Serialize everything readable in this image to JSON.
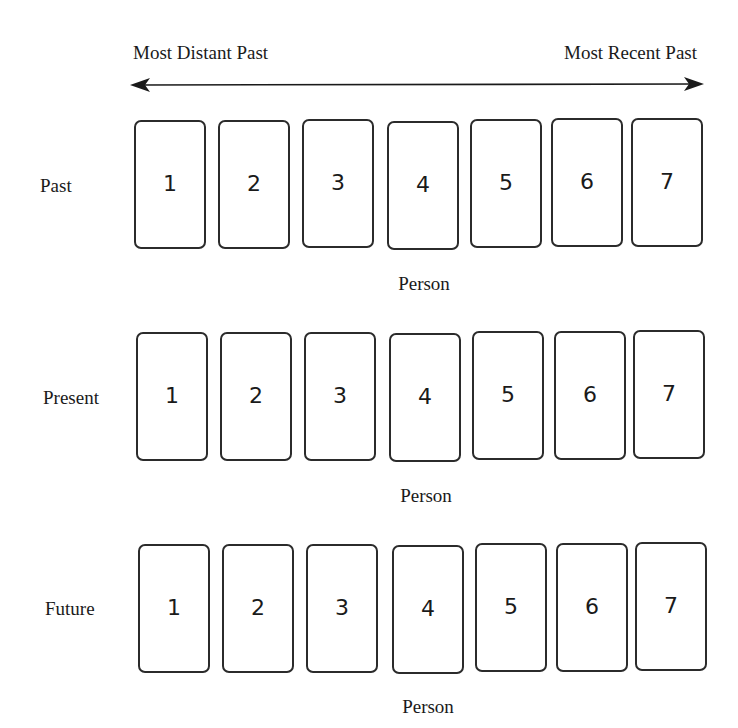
{
  "axis": {
    "left_label": "Most Distant Past",
    "right_label": "Most Recent Past",
    "direction": "bidirectional-arrow",
    "arrow_color": "#1a1a1a"
  },
  "rows": [
    {
      "label": "Past",
      "x_axis_label": "Person",
      "cards": [
        "1",
        "2",
        "3",
        "4",
        "5",
        "6",
        "7"
      ]
    },
    {
      "label": "Present",
      "x_axis_label": "Person",
      "cards": [
        "1",
        "2",
        "3",
        "4",
        "5",
        "6",
        "7"
      ]
    },
    {
      "label": "Future",
      "x_axis_label": "Person",
      "cards": [
        "1",
        "2",
        "3",
        "4",
        "5",
        "6",
        "7"
      ]
    }
  ],
  "colors": {
    "background": "#ffffff",
    "card_border": "#2b2b2b",
    "text": "#1a1a1a"
  }
}
